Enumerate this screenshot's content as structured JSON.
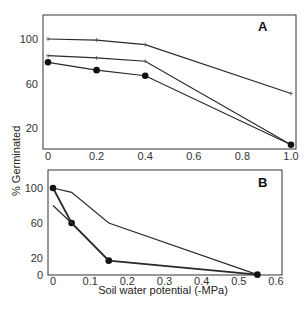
{
  "chart_data": [
    {
      "type": "line",
      "panel_label": "A",
      "x": [
        0,
        0.2,
        0.4,
        1.0
      ],
      "xticks": [
        "0",
        "0.2",
        "0.4",
        "0.6",
        "0.8",
        "1.0"
      ],
      "xtick_values": [
        0,
        0.2,
        0.4,
        0.6,
        0.8,
        1.0
      ],
      "yticks": [
        "20",
        "60",
        "100"
      ],
      "ytick_values": [
        20,
        60,
        100
      ],
      "xlim": [
        0,
        1.0
      ],
      "ylim": [
        0,
        120
      ],
      "grid": false,
      "series": [
        {
          "name": "series-1",
          "marker": "plus",
          "values": [
            100,
            99,
            95,
            51
          ]
        },
        {
          "name": "series-2",
          "marker": "plus",
          "values": [
            85,
            83,
            80,
            5
          ]
        },
        {
          "name": "series-3",
          "marker": "circle",
          "values": [
            79,
            72,
            67,
            5
          ]
        }
      ]
    },
    {
      "type": "line",
      "panel_label": "B",
      "xticks": [
        "0",
        "0.1",
        "0.2",
        "0.3",
        "0.4",
        "0.5",
        "0.6"
      ],
      "xtick_values": [
        0,
        0.1,
        0.2,
        0.3,
        0.4,
        0.5,
        0.6
      ],
      "yticks": [
        "0",
        "20",
        "60",
        "100"
      ],
      "ytick_values": [
        0,
        20,
        60,
        100
      ],
      "xlim": [
        0,
        0.6
      ],
      "ylim": [
        0,
        110
      ],
      "grid": false,
      "series": [
        {
          "name": "series-1",
          "marker": "none",
          "x": [
            0,
            0.05,
            0.15,
            0.55
          ],
          "values": [
            100,
            95,
            60,
            1
          ]
        },
        {
          "name": "series-2",
          "marker": "circle",
          "x": [
            0,
            0.05,
            0.15,
            0.55
          ],
          "values": [
            100,
            60,
            17,
            1
          ]
        },
        {
          "name": "series-3",
          "marker": "none",
          "x": [
            0,
            0.05,
            0.15
          ],
          "values": [
            80,
            60,
            17
          ]
        }
      ]
    }
  ],
  "labels": {
    "ylabel": "% Germinated",
    "xlabel": "Soil water potential (-MPa)",
    "panel_a": "A",
    "panel_b": "B"
  }
}
